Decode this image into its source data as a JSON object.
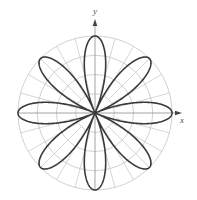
{
  "chart_data": {
    "type": "polar-line",
    "title": "",
    "equation_form": "r = a cos(4θ)",
    "petals": 8,
    "petal_angles_deg": [
      0,
      45,
      90,
      135,
      180,
      225,
      270,
      315
    ],
    "series": [
      {
        "name": "rose curve",
        "k": 4,
        "amplitude": 1.0,
        "color": "#3a3a3a"
      }
    ],
    "xlabel": "x",
    "ylabel": "y",
    "grid": {
      "on": true,
      "circle_radii_fraction": [
        0.25,
        0.5,
        0.75,
        1.0
      ],
      "ray_step_deg": 15,
      "color": "#c4c4c4"
    },
    "rlim": [
      0,
      1
    ]
  },
  "layout": {
    "cx": 95,
    "cy": 113,
    "radius": 77,
    "x_axis_end": 182,
    "y_axis_end": 19
  },
  "labels": {
    "x": "x",
    "y": "y"
  }
}
